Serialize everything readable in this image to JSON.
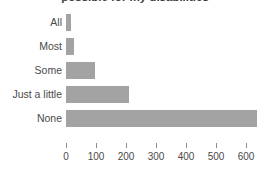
{
  "chart_data": {
    "type": "bar",
    "orientation": "horizontal",
    "title": "possible for my disabilities",
    "xlabel": "",
    "ylabel": "",
    "categories": [
      "All",
      "Most",
      "Some",
      "Just a little",
      "None"
    ],
    "values": [
      15,
      25,
      95,
      210,
      638
    ],
    "xlim": [
      0,
      660
    ],
    "xticks": [
      0,
      100,
      200,
      300,
      400,
      500,
      600
    ],
    "xtick_labels": [
      "0",
      "100",
      "200",
      "300",
      "400",
      "500",
      "600"
    ],
    "grid": false,
    "legend": false,
    "bar_color": "#a3a3a3",
    "text_color": "#4a4a4a"
  }
}
